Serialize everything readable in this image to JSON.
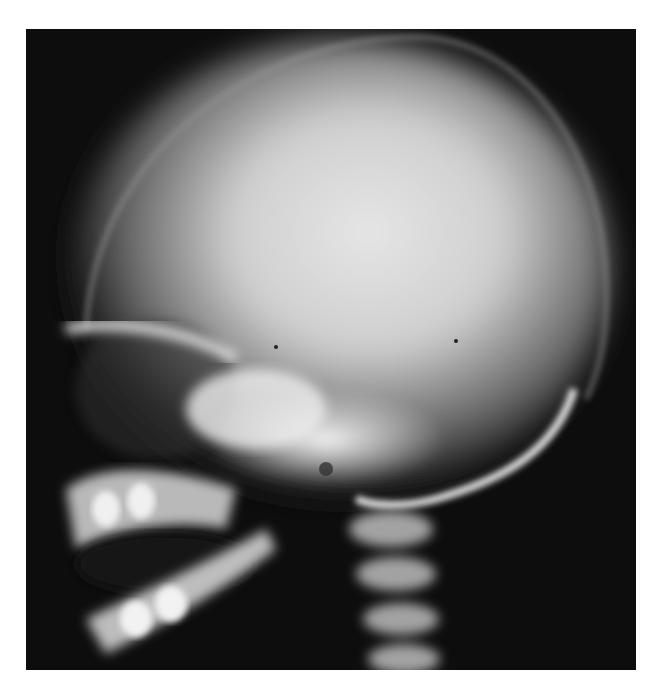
{
  "image": {
    "subject": "lateral skull radiograph",
    "background_color": "#ffffff",
    "film_color": "#0d0d0d",
    "bone_color": "#e8e8e8"
  }
}
